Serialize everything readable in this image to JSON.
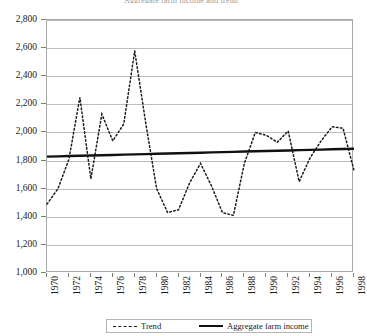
{
  "chart_data": {
    "type": "line",
    "title": "Aggregate farm income and trend",
    "xlabel": "",
    "ylabel": "",
    "xlim": [
      1970,
      1998
    ],
    "ylim": [
      1000,
      2800
    ],
    "ytick_step": 200,
    "xtick_step": 2,
    "grid": true,
    "legend_position": "bottom",
    "ytick_labels": [
      "1,000",
      "1,200",
      "1,400",
      "1,600",
      "1,800",
      "2,000",
      "2,200",
      "2,400",
      "2,600",
      "2,800"
    ],
    "ytick_values": [
      1000,
      1200,
      1400,
      1600,
      1800,
      2000,
      2200,
      2400,
      2600,
      2800
    ],
    "xtick_labels": [
      "1970",
      "1972",
      "1974",
      "1976",
      "1978",
      "1980",
      "1982",
      "1984",
      "1986",
      "1988",
      "1990",
      "1992",
      "1994",
      "1996",
      "1998"
    ],
    "xtick_values": [
      1970,
      1972,
      1974,
      1976,
      1978,
      1980,
      1982,
      1984,
      1986,
      1988,
      1990,
      1992,
      1994,
      1996,
      1998
    ],
    "x": [
      1970,
      1971,
      1972,
      1973,
      1974,
      1975,
      1976,
      1977,
      1978,
      1979,
      1980,
      1981,
      1982,
      1983,
      1984,
      1985,
      1986,
      1987,
      1988,
      1989,
      1990,
      1991,
      1992,
      1993,
      1994,
      1995,
      1996,
      1997,
      1998
    ],
    "series": [
      {
        "name": "Trend",
        "style": "dashed",
        "color": "#1a1a1a",
        "values": [
          1490,
          1600,
          1810,
          2250,
          1670,
          2130,
          1940,
          2060,
          2580,
          2070,
          1600,
          1430,
          1450,
          1640,
          1780,
          1620,
          1430,
          1410,
          1780,
          2000,
          1980,
          1930,
          2010,
          1650,
          1820,
          1940,
          2040,
          2030,
          1730
        ]
      },
      {
        "name": "Aggregate farm income",
        "style": "solid",
        "color": "#111111",
        "values": [
          1828,
          1830,
          1832,
          1834,
          1836,
          1838,
          1840,
          1842,
          1844,
          1846,
          1848,
          1850,
          1852,
          1854,
          1856,
          1858,
          1860,
          1862,
          1864,
          1866,
          1868,
          1870,
          1872,
          1874,
          1876,
          1878,
          1880,
          1882,
          1884
        ]
      }
    ]
  },
  "legend": {
    "trend_label": "Trend",
    "income_label": "Aggregate farm income"
  },
  "colors": {
    "grid": "#bdbdbd",
    "frame": "#a8a8a8",
    "text": "#1a1a1a",
    "trend": "#1a1a1a",
    "income": "#111111"
  }
}
